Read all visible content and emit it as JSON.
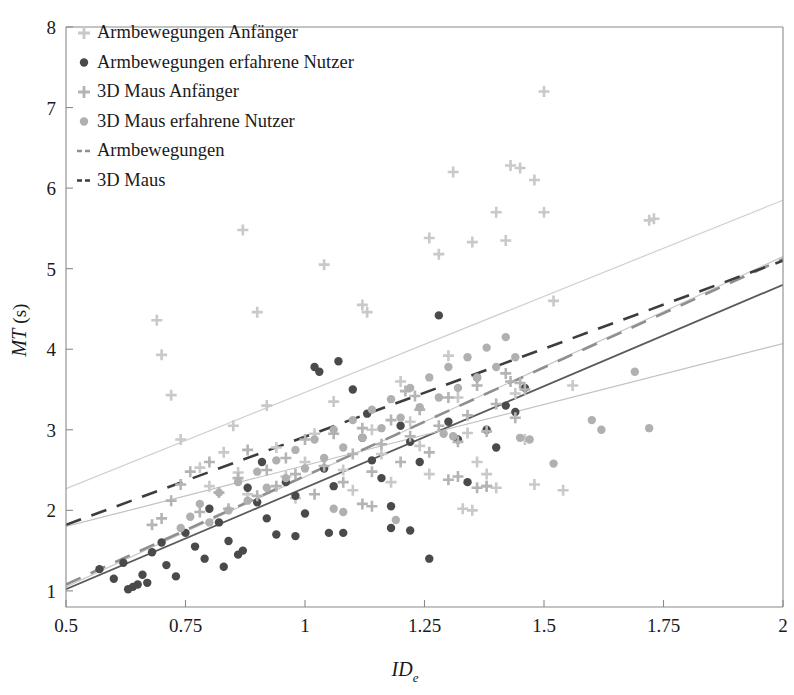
{
  "chart_data": {
    "type": "scatter",
    "title": "",
    "xlabel": "IDe",
    "xlabel_base": "ID",
    "xlabel_sub": "e",
    "ylabel": "MT (s)",
    "ylabel_base": "MT",
    "ylabel_unit": "(s)",
    "xlim": [
      0.5,
      2.0
    ],
    "ylim": [
      0.8,
      8.0
    ],
    "xticks": [
      0.5,
      0.75,
      1,
      1.25,
      1.5,
      1.75,
      2
    ],
    "xticklabels": [
      "0.5",
      "0.75",
      "1",
      "1.25",
      "1.5",
      "1.75",
      "2"
    ],
    "yticks": [
      1,
      2,
      3,
      4,
      5,
      6,
      7,
      8
    ],
    "yticklabels": [
      "1",
      "2",
      "3",
      "4",
      "5",
      "6",
      "7",
      "8"
    ],
    "grid": false,
    "legend_position": "top-left",
    "legend": [
      {
        "label": "Armbewegungen Anfänger",
        "marker": "plus",
        "color": "#c9c9c9"
      },
      {
        "label": "Armbewegungen erfahrene Nutzer",
        "marker": "dot",
        "color": "#4a4a4a"
      },
      {
        "label": "3D Maus Anfänger",
        "marker": "plus",
        "color": "#b4b4b4"
      },
      {
        "label": "3D Maus erfahrene Nutzer",
        "marker": "dot",
        "color": "#b0b0b0"
      },
      {
        "label": "Armbewegungen",
        "marker": "dashed-line",
        "color": "#8f8f8f"
      },
      {
        "label": "3D Maus",
        "marker": "dashed-line",
        "color": "#3d3d3d"
      }
    ],
    "series": [
      {
        "name": "Armbewegungen Anfänger",
        "marker": "plus",
        "color": "#c9c9c9",
        "points": [
          [
            0.69,
            4.36
          ],
          [
            0.7,
            3.93
          ],
          [
            0.72,
            3.43
          ],
          [
            0.74,
            2.88
          ],
          [
            0.78,
            2.53
          ],
          [
            0.8,
            2.3
          ],
          [
            0.83,
            2.72
          ],
          [
            0.85,
            3.05
          ],
          [
            0.86,
            2.47
          ],
          [
            0.88,
            2.2
          ],
          [
            0.9,
            4.46
          ],
          [
            0.92,
            3.3
          ],
          [
            0.94,
            2.78
          ],
          [
            0.96,
            2.42
          ],
          [
            0.98,
            2.15
          ],
          [
            1.0,
            2.6
          ],
          [
            1.02,
            2.95
          ],
          [
            1.04,
            5.05
          ],
          [
            1.06,
            3.35
          ],
          [
            1.08,
            2.5
          ],
          [
            1.1,
            2.25
          ],
          [
            1.12,
            4.55
          ],
          [
            1.14,
            3.0
          ],
          [
            1.16,
            2.7
          ],
          [
            1.18,
            2.35
          ],
          [
            1.2,
            3.6
          ],
          [
            1.22,
            3.1
          ],
          [
            1.24,
            2.8
          ],
          [
            1.26,
            2.45
          ],
          [
            1.28,
            5.18
          ],
          [
            1.3,
            3.92
          ],
          [
            1.32,
            3.4
          ],
          [
            1.34,
            2.96
          ],
          [
            1.36,
            2.6
          ],
          [
            1.38,
            2.3
          ],
          [
            1.4,
            5.7
          ],
          [
            1.42,
            5.35
          ],
          [
            1.44,
            3.45
          ],
          [
            1.46,
            2.88
          ],
          [
            1.48,
            2.32
          ],
          [
            1.5,
            5.7
          ],
          [
            1.52,
            4.6
          ],
          [
            1.54,
            2.25
          ],
          [
            1.56,
            3.55
          ],
          [
            0.87,
            5.48
          ],
          [
            1.13,
            4.46
          ],
          [
            1.26,
            5.38
          ],
          [
            1.31,
            6.2
          ],
          [
            1.35,
            5.33
          ],
          [
            1.43,
            6.28
          ],
          [
            1.45,
            6.25
          ],
          [
            1.48,
            6.1
          ],
          [
            1.5,
            7.2
          ],
          [
            1.72,
            5.6
          ],
          [
            1.73,
            5.62
          ],
          [
            1.33,
            2.02
          ],
          [
            1.35,
            2.0
          ],
          [
            1.38,
            2.45
          ],
          [
            1.4,
            2.28
          ]
        ]
      },
      {
        "name": "Armbewegungen erfahrene Nutzer",
        "marker": "dot",
        "color": "#4a4a4a",
        "points": [
          [
            0.57,
            1.27
          ],
          [
            0.6,
            1.15
          ],
          [
            0.62,
            1.35
          ],
          [
            0.64,
            1.05
          ],
          [
            0.65,
            1.08
          ],
          [
            0.66,
            1.2
          ],
          [
            0.68,
            1.48
          ],
          [
            0.7,
            1.6
          ],
          [
            0.71,
            1.32
          ],
          [
            0.73,
            1.18
          ],
          [
            0.75,
            1.72
          ],
          [
            0.77,
            1.55
          ],
          [
            0.79,
            1.4
          ],
          [
            0.8,
            2.02
          ],
          [
            0.82,
            1.85
          ],
          [
            0.84,
            1.62
          ],
          [
            0.86,
            1.45
          ],
          [
            0.88,
            2.28
          ],
          [
            0.9,
            2.1
          ],
          [
            0.92,
            1.9
          ],
          [
            0.94,
            1.7
          ],
          [
            0.96,
            2.35
          ],
          [
            0.98,
            2.18
          ],
          [
            1.0,
            1.96
          ],
          [
            1.02,
            3.78
          ],
          [
            1.04,
            2.52
          ],
          [
            1.06,
            2.3
          ],
          [
            1.08,
            1.72
          ],
          [
            1.1,
            3.5
          ],
          [
            1.12,
            2.9
          ],
          [
            1.14,
            2.62
          ],
          [
            1.16,
            2.4
          ],
          [
            1.18,
            1.78
          ],
          [
            1.2,
            3.05
          ],
          [
            1.22,
            2.85
          ],
          [
            1.24,
            2.6
          ],
          [
            1.26,
            1.4
          ],
          [
            1.28,
            4.42
          ],
          [
            1.3,
            3.1
          ],
          [
            1.32,
            2.88
          ],
          [
            1.34,
            2.35
          ],
          [
            1.36,
            3.65
          ],
          [
            1.38,
            3.0
          ],
          [
            1.4,
            2.78
          ],
          [
            1.42,
            3.3
          ],
          [
            1.44,
            3.22
          ],
          [
            1.46,
            3.52
          ],
          [
            0.98,
            1.68
          ],
          [
            1.05,
            1.72
          ],
          [
            1.18,
            2.05
          ],
          [
            1.22,
            1.75
          ],
          [
            0.83,
            1.3
          ],
          [
            0.87,
            1.5
          ],
          [
            0.91,
            2.6
          ],
          [
            1.13,
            3.2
          ],
          [
            1.03,
            3.72
          ],
          [
            1.07,
            3.85
          ],
          [
            0.63,
            1.02
          ],
          [
            0.67,
            1.1
          ]
        ]
      },
      {
        "name": "3D Maus Anfänger",
        "marker": "plus",
        "color": "#b4b4b4",
        "points": [
          [
            0.72,
            2.12
          ],
          [
            0.74,
            2.32
          ],
          [
            0.76,
            2.48
          ],
          [
            0.78,
            1.98
          ],
          [
            0.8,
            2.6
          ],
          [
            0.82,
            2.22
          ],
          [
            0.84,
            2.02
          ],
          [
            0.86,
            2.4
          ],
          [
            0.88,
            2.75
          ],
          [
            0.9,
            2.18
          ],
          [
            0.92,
            2.5
          ],
          [
            0.94,
            2.3
          ],
          [
            0.96,
            2.65
          ],
          [
            0.98,
            2.45
          ],
          [
            1.0,
            2.88
          ],
          [
            1.02,
            2.2
          ],
          [
            1.04,
            2.55
          ],
          [
            1.06,
            2.95
          ],
          [
            1.08,
            2.35
          ],
          [
            1.1,
            2.7
          ],
          [
            1.12,
            3.02
          ],
          [
            1.14,
            2.48
          ],
          [
            1.16,
            2.82
          ],
          [
            1.18,
            3.12
          ],
          [
            1.2,
            2.6
          ],
          [
            1.22,
            2.92
          ],
          [
            1.24,
            3.25
          ],
          [
            1.26,
            2.72
          ],
          [
            1.28,
            3.05
          ],
          [
            1.3,
            3.4
          ],
          [
            1.32,
            2.85
          ],
          [
            1.34,
            3.18
          ],
          [
            1.36,
            3.55
          ],
          [
            1.38,
            2.98
          ],
          [
            1.4,
            3.32
          ],
          [
            1.42,
            3.7
          ],
          [
            1.44,
            3.15
          ],
          [
            1.46,
            3.5
          ],
          [
            0.68,
            1.82
          ],
          [
            0.7,
            1.9
          ],
          [
            1.21,
            3.48
          ],
          [
            1.23,
            3.42
          ],
          [
            1.43,
            3.6
          ],
          [
            1.45,
            3.58
          ],
          [
            1.12,
            2.08
          ],
          [
            1.14,
            2.05
          ],
          [
            1.3,
            2.38
          ],
          [
            1.32,
            2.42
          ],
          [
            1.36,
            2.28
          ],
          [
            1.38,
            2.3
          ]
        ]
      },
      {
        "name": "3D Maus erfahrene Nutzer",
        "marker": "dot",
        "color": "#b0b0b0",
        "points": [
          [
            0.74,
            1.78
          ],
          [
            0.76,
            1.92
          ],
          [
            0.78,
            2.08
          ],
          [
            0.8,
            1.85
          ],
          [
            0.82,
            2.22
          ],
          [
            0.84,
            2.0
          ],
          [
            0.86,
            2.35
          ],
          [
            0.88,
            2.12
          ],
          [
            0.9,
            2.48
          ],
          [
            0.92,
            2.28
          ],
          [
            0.94,
            2.62
          ],
          [
            0.96,
            2.4
          ],
          [
            0.98,
            2.75
          ],
          [
            1.0,
            2.52
          ],
          [
            1.02,
            2.88
          ],
          [
            1.04,
            2.65
          ],
          [
            1.06,
            3.0
          ],
          [
            1.08,
            2.78
          ],
          [
            1.1,
            3.12
          ],
          [
            1.12,
            2.9
          ],
          [
            1.14,
            3.25
          ],
          [
            1.16,
            3.02
          ],
          [
            1.18,
            3.38
          ],
          [
            1.2,
            3.15
          ],
          [
            1.22,
            3.52
          ],
          [
            1.24,
            3.28
          ],
          [
            1.26,
            3.65
          ],
          [
            1.28,
            3.4
          ],
          [
            1.3,
            3.78
          ],
          [
            1.32,
            3.52
          ],
          [
            1.34,
            3.9
          ],
          [
            1.36,
            3.65
          ],
          [
            1.38,
            4.02
          ],
          [
            1.4,
            3.78
          ],
          [
            1.42,
            4.15
          ],
          [
            1.44,
            3.9
          ],
          [
            1.29,
            2.95
          ],
          [
            1.31,
            2.92
          ],
          [
            1.45,
            2.9
          ],
          [
            1.47,
            2.88
          ],
          [
            1.52,
            2.58
          ],
          [
            1.6,
            3.12
          ],
          [
            1.62,
            3.0
          ],
          [
            1.69,
            3.72
          ],
          [
            1.72,
            3.02
          ],
          [
            1.06,
            2.02
          ],
          [
            1.08,
            1.98
          ],
          [
            1.19,
            1.88
          ]
        ]
      }
    ],
    "trendlines": [
      {
        "name": "Armbewegungen Anfänger fit",
        "style": "solid",
        "color": "#cfcfcf",
        "width": 1.2,
        "x0": 0.5,
        "y0": 2.27,
        "x1": 2.0,
        "y1": 5.85
      },
      {
        "name": "Armbewegungen erfahrene Nutzer fit",
        "style": "solid",
        "color": "#5a5a5a",
        "width": 1.8,
        "x0": 0.5,
        "y0": 1.02,
        "x1": 2.0,
        "y1": 4.8
      },
      {
        "name": "3D Maus Anfänger fit",
        "style": "solid",
        "color": "#c2c2c2",
        "width": 1.2,
        "x0": 0.5,
        "y0": 1.8,
        "x1": 2.0,
        "y1": 4.07
      },
      {
        "name": "3D Maus erfahrene Nutzer fit",
        "style": "solid",
        "color": "#c8c8c8",
        "width": 1.2,
        "x0": 0.5,
        "y0": 1.05,
        "x1": 2.0,
        "y1": 5.15
      },
      {
        "name": "Armbewegungen aggregate",
        "style": "dashed",
        "color": "#8f8f8f",
        "width": 2.6,
        "x0": 0.5,
        "y0": 1.08,
        "x1": 2.0,
        "y1": 5.12
      },
      {
        "name": "3D Maus aggregate",
        "style": "dashed",
        "color": "#3d3d3d",
        "width": 2.6,
        "x0": 0.5,
        "y0": 1.82,
        "x1": 2.0,
        "y1": 5.1
      }
    ]
  }
}
